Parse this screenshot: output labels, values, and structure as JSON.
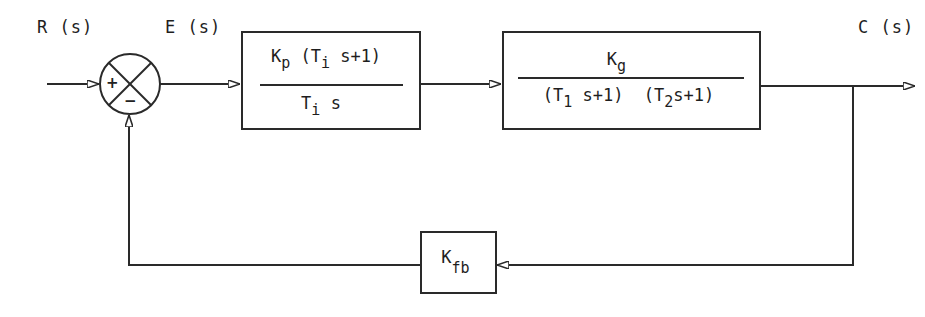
{
  "diagram": {
    "type": "closed-loop control block diagram",
    "signals": {
      "input": "R (s)",
      "error": "E (s)",
      "output": "C (s)"
    },
    "summing_junction": {
      "plus_sign": "+",
      "minus_sign": "−"
    },
    "controller_block": {
      "numerator": {
        "K": "K",
        "K_sub": "p",
        "paren_open": " (T",
        "T_sub": "i",
        "rest": " s+1)"
      },
      "denominator": {
        "T": "T",
        "T_sub": "i",
        "rest": " s"
      }
    },
    "plant_block": {
      "numerator": {
        "K": "K",
        "K_sub": "g"
      },
      "denominator": {
        "p1_open": "(T",
        "p1_sub": "1",
        "p1_rest": " s+1)",
        "p2_open": "  (T",
        "p2_sub": "2",
        "p2_rest": "s+1)"
      }
    },
    "feedback_block": {
      "K": "K",
      "K_sub": "fb"
    },
    "colors": {
      "line": "#2a2a2a",
      "background": "#ffffff"
    }
  }
}
